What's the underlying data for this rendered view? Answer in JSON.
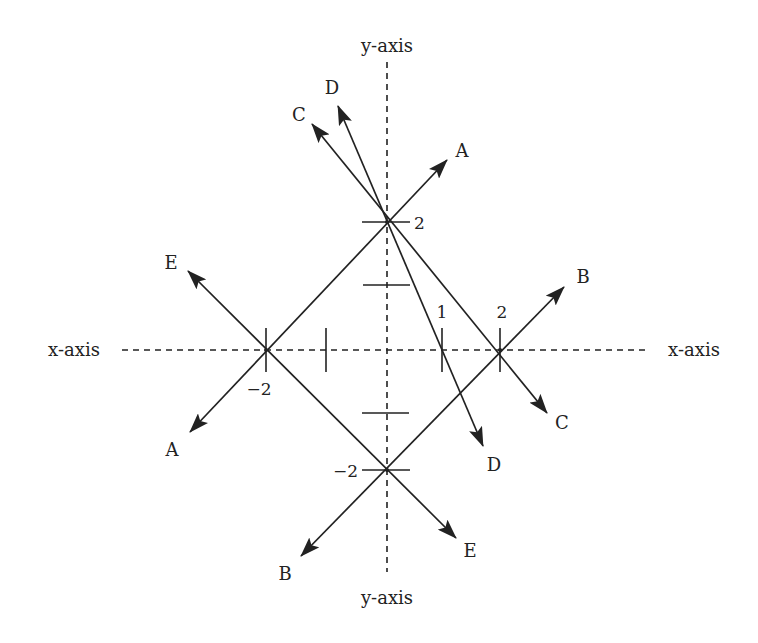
{
  "diagram": {
    "type": "coordinate-plane-lines",
    "colors": {
      "ink": "#222222",
      "background": "#ffffff"
    },
    "axes": {
      "x_axis": {
        "label_left": "x-axis",
        "label_right": "x-axis",
        "style": "dashed"
      },
      "y_axis": {
        "label_top": "y-axis",
        "label_bottom": "y-axis",
        "style": "dashed"
      }
    },
    "tick_labels": {
      "x_pos_1": "1",
      "x_pos_2": "2",
      "x_neg_2": "−2",
      "y_pos_2": "2",
      "y_neg_2": "−2"
    },
    "lines": [
      {
        "id": "A",
        "label_start": "A",
        "label_end": "A",
        "through": [
          [
            -2,
            0
          ],
          [
            0,
            2
          ]
        ],
        "description": "y = x + 2"
      },
      {
        "id": "B",
        "label_start": "B",
        "label_end": "B",
        "through": [
          [
            0,
            -2
          ],
          [
            2,
            0
          ]
        ],
        "description": "y = x - 2"
      },
      {
        "id": "C",
        "label_start": "C",
        "label_end": "C",
        "through": [
          [
            0,
            2
          ],
          [
            2,
            0
          ]
        ],
        "description": "y = -x + 2"
      },
      {
        "id": "D",
        "label_start": "D",
        "label_end": "D",
        "through": [
          [
            0,
            2
          ],
          [
            1,
            0
          ]
        ],
        "description": "y = -2x + 2"
      },
      {
        "id": "E",
        "label_start": "E",
        "label_end": "E",
        "through": [
          [
            -2,
            0
          ],
          [
            0,
            -2
          ]
        ],
        "description": "y = -x - 2"
      }
    ]
  }
}
